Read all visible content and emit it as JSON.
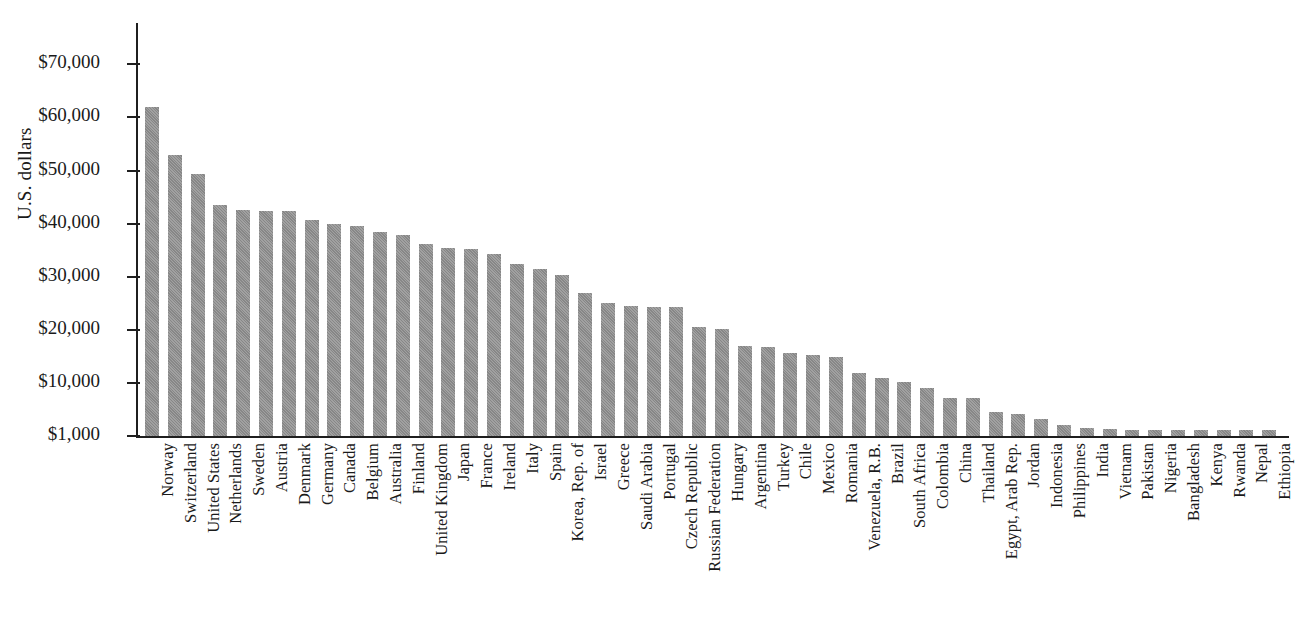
{
  "chart_data": {
    "type": "bar",
    "title": "",
    "xlabel": "",
    "ylabel": "U.S. dollars",
    "ylim": [
      1000,
      75000
    ],
    "grid": false,
    "legend": null,
    "bar_color": "#8f8f8f",
    "axis_color": "#1f1f1f",
    "y_ticks": [
      1000,
      10000,
      20000,
      30000,
      40000,
      50000,
      60000,
      70000
    ],
    "y_tick_labels": [
      "$1,000",
      "$10,000",
      "$20,000",
      "$30,000",
      "$40,000",
      "$50,000",
      "$60,000",
      "$70,000"
    ],
    "categories": [
      "Norway",
      "Switzerland",
      "United States",
      "Netherlands",
      "Sweden",
      "Austria",
      "Denmark",
      "Germany",
      "Canada",
      "Belgium",
      "Australia",
      "Finland",
      "United Kingdom",
      "Japan",
      "France",
      "Ireland",
      "Italy",
      "Spain",
      "Korea, Rep. of",
      "Israel",
      "Greece",
      "Saudi Arabia",
      "Portugal",
      "Czech Republic",
      "Russian Federation",
      "Hungary",
      "Argentina",
      "Turkey",
      "Chile",
      "Mexico",
      "Romania",
      "Venezuela, R.B.",
      "Brazil",
      "South Africa",
      "Colombia",
      "China",
      "Thailand",
      "Egypt, Arab Rep.",
      "Jordan",
      "Indonesia",
      "Philippines",
      "India",
      "Vietnam",
      "Pakistan",
      "Nigeria",
      "Bangladesh",
      "Kenya",
      "Rwanda",
      "Nepal",
      "Ethiopia"
    ],
    "values": [
      62000,
      53000,
      49300,
      43500,
      42500,
      42400,
      42300,
      40700,
      39900,
      39500,
      38400,
      37900,
      36200,
      35400,
      35300,
      34300,
      32400,
      31400,
      30300,
      27000,
      25000,
      24500,
      24300,
      24200,
      20500,
      20100,
      16900,
      16700,
      15700,
      15200,
      14800,
      11800,
      10900,
      10100,
      9100,
      7400,
      7400,
      5100,
      4700,
      3800,
      2900,
      2400,
      2200,
      1800,
      1600,
      1200,
      1000,
      860,
      800,
      720
    ]
  }
}
